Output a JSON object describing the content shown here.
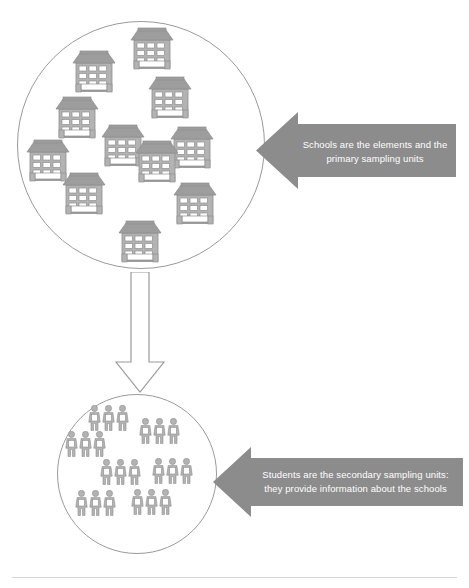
{
  "diagram": {
    "type": "cluster-sampling-diagram",
    "colors": {
      "banner_fill": "#8c8c8c",
      "circle_stroke": "#9a9a9a",
      "icon_fill": "#b3b3b3",
      "icon_stroke": "#8f8f8f",
      "banner_text": "#ffffff",
      "divider": "#d7d7d7",
      "background": "#ffffff"
    },
    "stages": [
      {
        "id": "stage-1",
        "name": "schools-cluster",
        "icon": "school-building-icon",
        "count": 11,
        "callout": "Schools are the elements and the\nprimary sampling units"
      },
      {
        "id": "stage-2",
        "name": "students-cluster",
        "icon": "person-icon",
        "count": 21,
        "callout": "Students are the secondary sampling units:\nthey provide information about the schools"
      }
    ],
    "connector": {
      "name": "down-arrow-connector",
      "direction": "down",
      "style": "outlined-white"
    },
    "schools": [
      {
        "id": "school-1",
        "x": 128,
        "y": 25
      },
      {
        "id": "school-2",
        "x": 70,
        "y": 48
      },
      {
        "id": "school-3",
        "x": 146,
        "y": 74
      },
      {
        "id": "school-4",
        "x": 53,
        "y": 94
      },
      {
        "id": "school-5",
        "x": 99,
        "y": 122
      },
      {
        "id": "school-6",
        "x": 168,
        "y": 124
      },
      {
        "id": "school-7",
        "x": 24,
        "y": 137
      },
      {
        "id": "school-8",
        "x": 133,
        "y": 138
      },
      {
        "id": "school-9",
        "x": 60,
        "y": 170
      },
      {
        "id": "school-10",
        "x": 171,
        "y": 180
      },
      {
        "id": "school-11",
        "x": 116,
        "y": 218
      }
    ],
    "student_groups": [
      {
        "id": "student-group-1",
        "x": 88,
        "y": 405,
        "count": 3
      },
      {
        "id": "student-group-2",
        "x": 139,
        "y": 418,
        "count": 3
      },
      {
        "id": "student-group-3",
        "x": 65,
        "y": 431,
        "count": 3
      },
      {
        "id": "student-group-4",
        "x": 100,
        "y": 459,
        "count": 3
      },
      {
        "id": "student-group-5",
        "x": 152,
        "y": 458,
        "count": 3
      },
      {
        "id": "student-group-6",
        "x": 75,
        "y": 490,
        "count": 3
      },
      {
        "id": "student-group-7",
        "x": 131,
        "y": 489,
        "count": 3
      }
    ]
  }
}
